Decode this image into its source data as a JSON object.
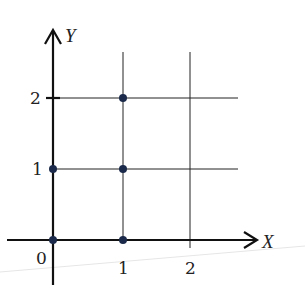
{
  "diagram": {
    "axes": {
      "x_label": "X",
      "y_label": "Y",
      "x_ticks": [
        "0",
        "1",
        "2"
      ],
      "y_ticks": [
        "1",
        "2"
      ]
    },
    "grid": {
      "vertical_lines_at_x": [
        1,
        2
      ],
      "horizontal_lines_at_y": [
        1,
        2
      ]
    },
    "points": [
      {
        "x": 0,
        "y": 0
      },
      {
        "x": 1,
        "y": 0
      },
      {
        "x": 0,
        "y": 1
      },
      {
        "x": 1,
        "y": 1
      },
      {
        "x": 1,
        "y": 2
      }
    ],
    "colors": {
      "axis": "#111111",
      "grid": "#222222",
      "point": "#1b2a4a",
      "background": "#ffffff"
    }
  }
}
